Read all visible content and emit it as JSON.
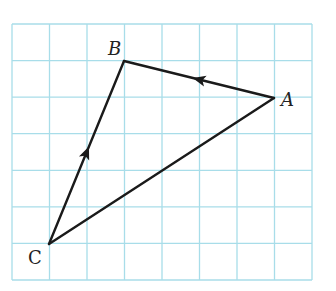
{
  "figure": {
    "type": "vector-triangle-on-grid",
    "colors": {
      "grid": "#a8dde9",
      "edges": "#1a1a1a",
      "labels": "#222222",
      "background": "#ffffff"
    },
    "grid": {
      "columns": 8,
      "rows": 7,
      "left": 12,
      "top": 24,
      "right": 312,
      "bottom": 280
    },
    "vertices": {
      "A": {
        "label": "A",
        "x": 274,
        "y": 98,
        "grid_col": 7,
        "grid_row": 2,
        "label_x": 281,
        "label_y": 106
      },
      "B": {
        "label": "B",
        "x": 124,
        "y": 61,
        "grid_col": 3,
        "grid_row": 1,
        "label_x": 108,
        "label_y": 55
      },
      "C": {
        "label": "C",
        "x": 49,
        "y": 244,
        "grid_col": 1,
        "grid_row": 6,
        "label_x": 28,
        "label_y": 264
      }
    },
    "edges": [
      {
        "from": "A",
        "to": "B",
        "arrow": true,
        "arrow_direction": "toward B"
      },
      {
        "from": "C",
        "to": "B",
        "arrow": true,
        "arrow_direction": "toward B"
      },
      {
        "from": "C",
        "to": "A",
        "arrow": false
      }
    ]
  }
}
